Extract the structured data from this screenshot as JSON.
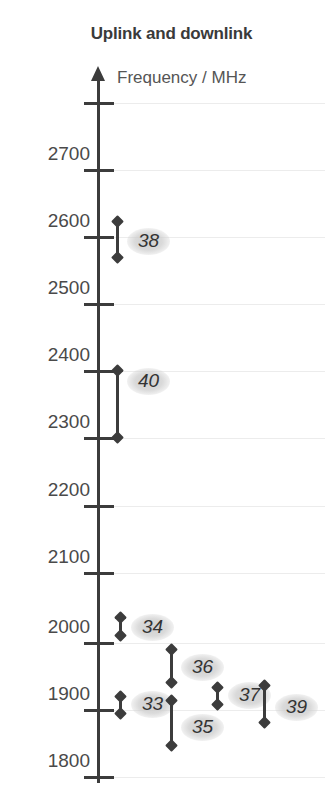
{
  "title": "Uplink and downlink",
  "axis": {
    "label": "Frequency / MHz",
    "unit": "MHz",
    "min": 1800,
    "max": 2800,
    "tick_step": 100,
    "arrow": "up-arrow-icon"
  },
  "ticks": [
    {
      "value": 2800,
      "label": "",
      "y": 103
    },
    {
      "value": 2700,
      "label": "2700",
      "y": 170
    },
    {
      "value": 2600,
      "label": "2600",
      "y": 237
    },
    {
      "value": 2500,
      "label": "2500",
      "y": 304
    },
    {
      "value": 2400,
      "label": "2400",
      "y": 371
    },
    {
      "value": 2300,
      "label": "2300",
      "y": 438
    },
    {
      "value": 2200,
      "label": "2200",
      "y": 506
    },
    {
      "value": 2100,
      "label": "2100",
      "y": 573
    },
    {
      "value": 2000,
      "label": "2000",
      "y": 643
    },
    {
      "value": 1900,
      "label": "1900",
      "y": 710
    },
    {
      "value": 1800,
      "label": "1800",
      "y": 777
    }
  ],
  "colors": {
    "axis": "#3c3c3c",
    "grid": "#ececec",
    "text": "#4a4a4a",
    "title": "#3a3a3a",
    "band": "#3c3c3c",
    "label_halo": "#c8c8c8",
    "background": "#ffffff"
  },
  "chart_data": {
    "type": "range-bar",
    "title": "Uplink and downlink",
    "xlabel": "",
    "ylabel": "Frequency / MHz",
    "ylim": [
      1800,
      2800
    ],
    "grid": true,
    "legend": "none",
    "orientation": "vertical",
    "categories": [
      "38",
      "40",
      "34",
      "36",
      "33",
      "35",
      "37",
      "39"
    ],
    "series": [
      {
        "name": "band-range",
        "values": [
          {
            "band": "38",
            "low": 2570,
            "high": 2620
          },
          {
            "band": "40",
            "low": 2300,
            "high": 2400
          },
          {
            "band": "34",
            "low": 2010,
            "high": 2025
          },
          {
            "band": "36",
            "low": 1930,
            "high": 1990
          },
          {
            "band": "33",
            "low": 1900,
            "high": 1920
          },
          {
            "band": "35",
            "low": 1850,
            "high": 1910
          },
          {
            "band": "37",
            "low": 1910,
            "high": 1930
          },
          {
            "band": "39",
            "low": 1880,
            "high": 1920
          }
        ]
      }
    ]
  },
  "bands": [
    {
      "id": "38",
      "label": "38",
      "bar_x": 116,
      "bar_top": 221,
      "bar_bottom": 258,
      "label_x": 127,
      "label_y": 228
    },
    {
      "id": "40",
      "label": "40",
      "bar_x": 116,
      "bar_top": 370,
      "bar_bottom": 438,
      "label_x": 127,
      "label_y": 368
    },
    {
      "id": "34",
      "label": "34",
      "bar_x": 119,
      "bar_top": 617,
      "bar_bottom": 636,
      "label_x": 131,
      "label_y": 614
    },
    {
      "id": "36",
      "label": "36",
      "bar_x": 170,
      "bar_top": 649,
      "bar_bottom": 683,
      "label_x": 181,
      "label_y": 654
    },
    {
      "id": "33",
      "label": "33",
      "bar_x": 119,
      "bar_top": 696,
      "bar_bottom": 714,
      "label_x": 131,
      "label_y": 691
    },
    {
      "id": "35",
      "label": "35",
      "bar_x": 170,
      "bar_top": 700,
      "bar_bottom": 746,
      "label_x": 181,
      "label_y": 714
    },
    {
      "id": "37",
      "label": "37",
      "bar_x": 216,
      "bar_top": 687,
      "bar_bottom": 705,
      "label_x": 228,
      "label_y": 682
    },
    {
      "id": "39",
      "label": "39",
      "bar_x": 263,
      "bar_top": 685,
      "bar_bottom": 723,
      "label_x": 275,
      "label_y": 694
    }
  ]
}
